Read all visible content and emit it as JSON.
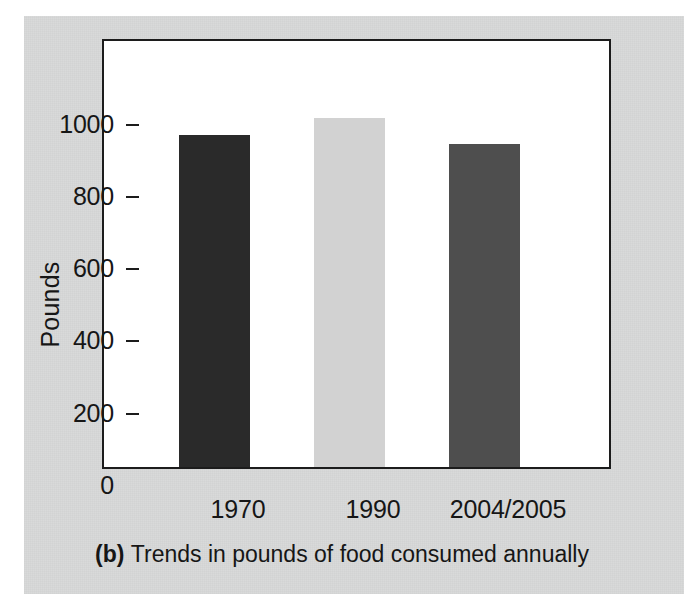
{
  "figure": {
    "caption_tag": "(b)",
    "caption_text": "Trends in pounds of food consumed annually",
    "panel_color": "#d8d9d9",
    "plot_background": "#ffffff",
    "frame_color": "#1c1c1c"
  },
  "chart_data": {
    "type": "bar",
    "title": "",
    "subtitle": "",
    "xlabel": "",
    "ylabel": "Pounds",
    "categories": [
      "1970",
      "1990",
      "2004/2005"
    ],
    "values": [
      920,
      965,
      895
    ],
    "series": [
      {
        "name": "Pounds of food consumed annually",
        "values": [
          920,
          965,
          895
        ]
      }
    ],
    "bar_colors": [
      "#2a2a2a",
      "#d2d2d2",
      "#4e4e4e"
    ],
    "ylim": [
      0,
      1190
    ],
    "yticks": [
      0,
      200,
      400,
      600,
      800,
      1000
    ],
    "ytick_labels": [
      "0",
      "200",
      "400",
      "600",
      "800",
      "1000"
    ],
    "grid": false,
    "legend": null,
    "legend_position": "none",
    "annotations": []
  }
}
